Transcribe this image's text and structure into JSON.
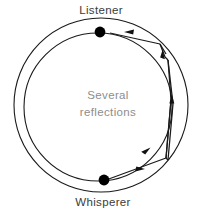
{
  "diagram": {
    "title_top": "Listener",
    "title_bottom": "Whisperer",
    "center_line1": "Several",
    "center_line2": "reflections",
    "colors": {
      "stroke": "#1a1a1a",
      "dot": "#000000",
      "label": "#3b3b3b",
      "center_label": "#8d8d8d",
      "background": "#ffffff"
    },
    "geometry": {
      "center_x": 101,
      "center_y": 106,
      "outer_radius": 87,
      "inner_radius": 75,
      "listener_x": 100,
      "listener_y": 32,
      "whisperer_x": 104,
      "whisperer_y": 180,
      "dot_radius": 5.4
    },
    "ray_description": "sound ray reflecting repeatedly along the inner wall from whisperer to listener",
    "arrow_count": 5
  }
}
